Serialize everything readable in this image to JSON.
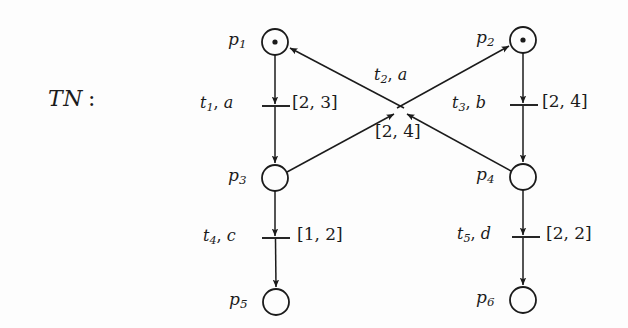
{
  "figure": {
    "title_label": "TN :",
    "title_parts": {
      "script": "TN",
      "colon": ":"
    },
    "background_color": "#fdfdfd",
    "stroke_color": "#1b1b1b"
  },
  "places": [
    {
      "id": "p1",
      "name": "p",
      "index": "1",
      "tokens": 1,
      "cx": 275,
      "cy": 42,
      "r": 13,
      "label_x": 228,
      "label_y": 31
    },
    {
      "id": "p2",
      "name": "p",
      "index": "2",
      "tokens": 1,
      "cx": 523,
      "cy": 40,
      "r": 13,
      "label_x": 476,
      "label_y": 29
    },
    {
      "id": "p3",
      "name": "p",
      "index": "3",
      "tokens": 0,
      "cx": 275,
      "cy": 178,
      "r": 13,
      "label_x": 228,
      "label_y": 167
    },
    {
      "id": "p4",
      "name": "p",
      "index": "4",
      "tokens": 0,
      "cx": 523,
      "cy": 177,
      "r": 13,
      "label_x": 476,
      "label_y": 166
    },
    {
      "id": "p5",
      "name": "p",
      "index": "5",
      "tokens": 0,
      "cx": 276,
      "cy": 302,
      "r": 13,
      "label_x": 229,
      "label_y": 291
    },
    {
      "id": "p6",
      "name": "p",
      "index": "6",
      "tokens": 0,
      "cx": 523,
      "cy": 300,
      "r": 13,
      "label_x": 476,
      "label_y": 289
    }
  ],
  "transitions": [
    {
      "id": "t1",
      "name": "t",
      "index": "1",
      "action": "a",
      "label_text": "t1, a",
      "label_x": 200,
      "label_y": 95,
      "interval": "[2, 3]",
      "interval_x": 292,
      "interval_y": 94,
      "bar_x1": 262,
      "bar_y1": 106,
      "bar_x2": 290,
      "bar_y2": 106
    },
    {
      "id": "t2",
      "name": "t",
      "index": "2",
      "action": "a",
      "label_text": "t2, a",
      "label_x": 374,
      "label_y": 67,
      "interval": "[2, 4]",
      "interval_x": 375,
      "interval_y": 123,
      "bar_x1": 0,
      "bar_y1": 0,
      "bar_x2": 0,
      "bar_y2": 0
    },
    {
      "id": "t3",
      "name": "t",
      "index": "3",
      "action": "b",
      "label_text": "t3, b",
      "label_x": 452,
      "label_y": 95,
      "interval": "[2, 4]",
      "interval_x": 542,
      "interval_y": 93,
      "bar_x1": 510,
      "bar_y1": 105,
      "bar_x2": 538,
      "bar_y2": 105
    },
    {
      "id": "t4",
      "name": "t",
      "index": "4",
      "action": "c",
      "label_text": "t4, c",
      "label_x": 203,
      "label_y": 228,
      "interval": "[1, 2]",
      "interval_x": 297,
      "interval_y": 226,
      "bar_x1": 262,
      "bar_y1": 238,
      "bar_x2": 290,
      "bar_y2": 238
    },
    {
      "id": "t5",
      "name": "t",
      "index": "5",
      "action": "d",
      "label_text": "t5, d",
      "label_x": 457,
      "label_y": 226,
      "interval": "[2, 2]",
      "interval_x": 546,
      "interval_y": 225,
      "bar_x1": 512,
      "bar_y1": 237,
      "bar_x2": 540,
      "bar_y2": 237
    }
  ],
  "arcs": [
    {
      "id": "arc-p1-t1",
      "from": "p1",
      "to": "t1",
      "kind": "vertical"
    },
    {
      "id": "arc-t1-p3",
      "from": "t1",
      "to": "p3",
      "kind": "vertical"
    },
    {
      "id": "arc-p2-t3",
      "from": "p2",
      "to": "t3",
      "kind": "vertical"
    },
    {
      "id": "arc-t3-p4",
      "from": "t3",
      "to": "p4",
      "kind": "vertical"
    },
    {
      "id": "arc-p3-t4",
      "from": "p3",
      "to": "t4",
      "kind": "vertical"
    },
    {
      "id": "arc-t4-p5",
      "from": "t4",
      "to": "p5",
      "kind": "vertical"
    },
    {
      "id": "arc-p4-t5",
      "from": "p4",
      "to": "t5",
      "kind": "vertical"
    },
    {
      "id": "arc-t5-p6",
      "from": "t5",
      "to": "p6",
      "kind": "vertical"
    },
    {
      "id": "arc-p3-t2",
      "from": "p3",
      "to": "t2",
      "kind": "diagonal-in"
    },
    {
      "id": "arc-p4-t2",
      "from": "p4",
      "to": "t2",
      "kind": "diagonal-in"
    },
    {
      "id": "arc-t2-p1",
      "from": "t2",
      "to": "p1",
      "kind": "diagonal-out"
    },
    {
      "id": "arc-t2-p2",
      "from": "t2",
      "to": "p2",
      "kind": "diagonal-out"
    }
  ]
}
